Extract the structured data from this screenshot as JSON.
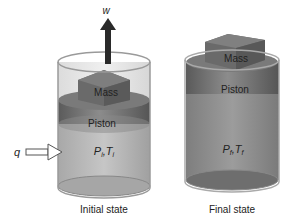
{
  "initial": {
    "work_label": "w",
    "mass_label": "Mass",
    "piston_label": "Piston",
    "heat_label": "q",
    "state_P": "P",
    "state_P_sub": "i",
    "state_T": "T",
    "state_T_sub": "i",
    "caption": "Initial state"
  },
  "final": {
    "mass_label": "Mass",
    "piston_label": "Piston",
    "state_P": "P",
    "state_P_sub": "f",
    "state_T": "T",
    "state_T_sub": "f",
    "caption": "Final state"
  },
  "colors": {
    "cylinder_wall": "#9a9a9a",
    "gas_initial": "#b9b9b9",
    "gas_final": "#8f8f8f",
    "piston": "#6e6e6e",
    "mass": "#6a6a6a",
    "arrow": "#2a2a2a"
  }
}
